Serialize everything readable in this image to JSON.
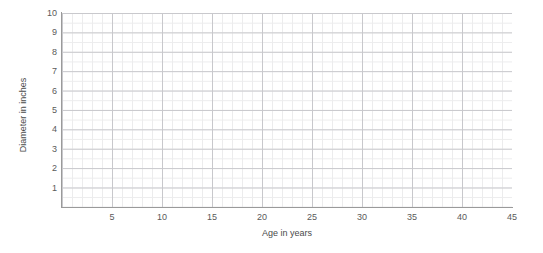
{
  "chart_data": {
    "type": "scatter",
    "title": "",
    "subtitle": "",
    "xlabel": "Age in years",
    "ylabel": "Diameter in inches",
    "xlim": [
      0,
      45
    ],
    "ylim": [
      0,
      10
    ],
    "x_tick_labels": [
      "5",
      "10",
      "15",
      "20",
      "25",
      "30",
      "35",
      "40",
      "45"
    ],
    "x_tick_values": [
      5,
      10,
      15,
      20,
      25,
      30,
      35,
      40,
      45
    ],
    "y_tick_labels": [
      "1",
      "2",
      "3",
      "4",
      "5",
      "6",
      "7",
      "8",
      "9",
      "10"
    ],
    "y_tick_values": [
      1,
      2,
      3,
      4,
      5,
      6,
      7,
      8,
      9,
      10
    ],
    "x_major_step": 5,
    "x_minor_step": 1,
    "y_major_step": 1,
    "y_minor_step": 0.5,
    "grid": true,
    "grid_major_color": "#c8c8cc",
    "grid_minor_color": "#ececed",
    "axis_color": "#9a9a9a",
    "legend": null,
    "legend_position": "none",
    "series": [],
    "annotations": [],
    "note": "Empty grid template with no plotted data points"
  },
  "axes": {
    "y_title": "Diameter in inches",
    "x_title": "Age in years"
  },
  "colors": {
    "background": "#ffffff",
    "axis": "#9a9a9a",
    "grid_major": "#c8c8cc",
    "grid_minor": "#ececed",
    "tick_text": "#5a5a5a",
    "title_text": "#4a4a4a"
  }
}
